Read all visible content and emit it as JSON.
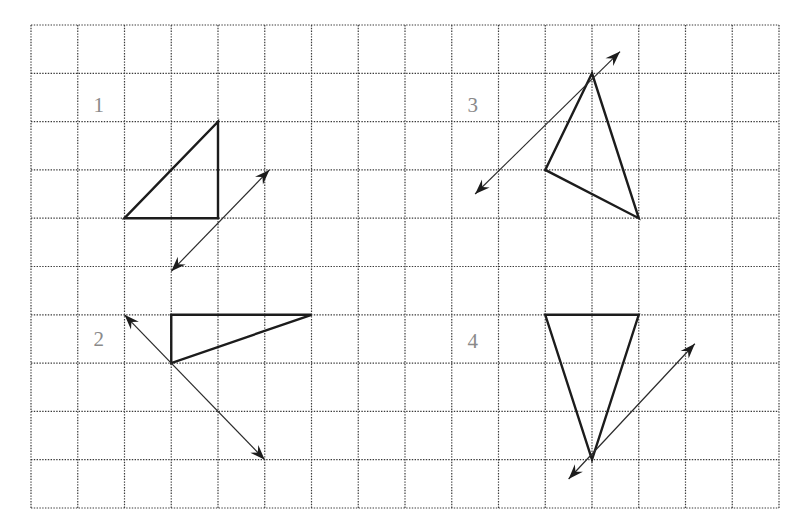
{
  "diagram": {
    "grid": {
      "left": 31,
      "top": 25,
      "cell_w": 46.75,
      "cell_h": 48.3,
      "cols": 16,
      "rows": 10,
      "line_color": "#3a3a3a"
    },
    "colors": {
      "shape": "#1c1c1c",
      "label": "#8a8a8a",
      "background": "#ffffff"
    },
    "figures": [
      {
        "label": "1",
        "label_pos": [
          1.45,
          1.65
        ],
        "triangle": [
          [
            2,
            4
          ],
          [
            4,
            2
          ],
          [
            4,
            4
          ]
        ],
        "reflection_line": {
          "from": [
            3.0,
            5.1
          ],
          "to": [
            5.1,
            3.0
          ]
        }
      },
      {
        "label": "2",
        "label_pos": [
          1.45,
          6.5
        ],
        "triangle": [
          [
            3,
            6
          ],
          [
            6,
            6
          ],
          [
            3,
            7
          ]
        ],
        "reflection_line": {
          "from": [
            2.0,
            6.0
          ],
          "to": [
            5.0,
            9.0
          ]
        }
      },
      {
        "label": "3",
        "label_pos": [
          9.45,
          1.65
        ],
        "triangle": [
          [
            12,
            1
          ],
          [
            11,
            3
          ],
          [
            13,
            4
          ]
        ],
        "reflection_line": {
          "from": [
            9.5,
            3.5
          ],
          "to": [
            12.6,
            0.55
          ]
        }
      },
      {
        "label": "4",
        "label_pos": [
          9.45,
          6.55
        ],
        "triangle": [
          [
            11,
            6
          ],
          [
            13,
            6
          ],
          [
            12,
            9
          ]
        ],
        "reflection_line": {
          "from": [
            11.5,
            9.4
          ],
          "to": [
            14.2,
            6.6
          ]
        }
      }
    ]
  }
}
